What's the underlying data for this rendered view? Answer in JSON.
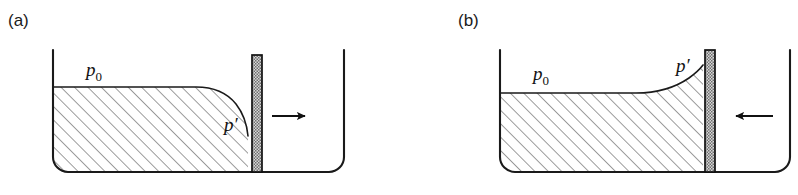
{
  "figure": {
    "background_color": "#ffffff",
    "line_color": "#1a1a1a",
    "hatch_color": "#555555",
    "piston_fill_color": "#a8a8a8",
    "width": 798,
    "height": 195
  },
  "panels": [
    {
      "id": "panel-a",
      "label": "(a)",
      "label_x": 8,
      "label_y": 26,
      "ambient_pressure_label": "p",
      "ambient_pressure_sub": "0",
      "ambient_pressure_x": 86,
      "ambient_pressure_y": 76,
      "local_pressure_label": "p",
      "local_pressure_prime": "′",
      "local_pressure_x": 224,
      "local_pressure_y": 131,
      "arrow_direction": "right",
      "arrow_x1": 272,
      "arrow_x2": 312,
      "arrow_y": 116,
      "meniscus": "depressed",
      "container": {
        "left_wall_x": 53,
        "right_wall_x": 344,
        "top_y": 50,
        "bottom_y": 172,
        "corner_radius": 15
      },
      "piston": {
        "x": 252,
        "width": 10,
        "top_y": 55,
        "bottom_y": 172
      },
      "fluid_surface_y": 87
    },
    {
      "id": "panel-b",
      "label": "(b)",
      "label_x": 458,
      "label_y": 26,
      "ambient_pressure_label": "p",
      "ambient_pressure_sub": "0",
      "ambient_pressure_x": 533,
      "ambient_pressure_y": 80,
      "local_pressure_label": "p",
      "local_pressure_prime": "′",
      "local_pressure_x": 676,
      "local_pressure_y": 72,
      "arrow_direction": "left",
      "arrow_x1": 773,
      "arrow_x2": 729,
      "arrow_y": 116,
      "meniscus": "raised",
      "container": {
        "left_wall_x": 500,
        "right_wall_x": 790,
        "top_y": 50,
        "bottom_y": 172,
        "corner_radius": 15
      },
      "piston": {
        "x": 705,
        "width": 10,
        "top_y": 50,
        "bottom_y": 172
      },
      "fluid_surface_y": 93
    }
  ]
}
